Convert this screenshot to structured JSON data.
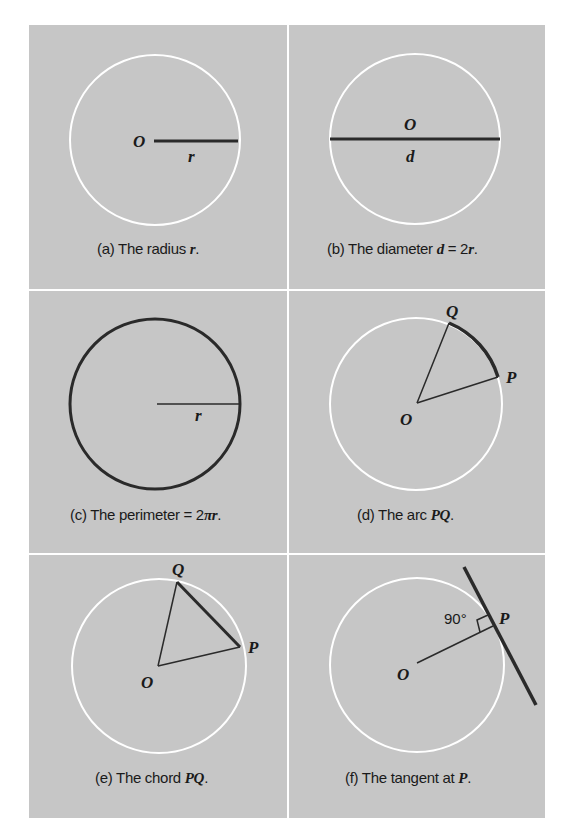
{
  "figure": {
    "background_color": "#c6c6c6",
    "divider_color": "#ffffff",
    "circle_color": "#ffffff",
    "ink_color": "#2a2a2a",
    "panels": [
      {
        "id": "a",
        "caption_prefix": "(a) The radius ",
        "caption_var": "r",
        "caption_suffix": ".",
        "labels": {
          "center": "O",
          "radius": "r"
        }
      },
      {
        "id": "b",
        "caption_prefix": "(b) The diameter ",
        "caption_var": "d",
        "caption_mid": " = 2",
        "caption_var2": "r",
        "caption_suffix": ".",
        "labels": {
          "center": "O",
          "diameter": "d"
        }
      },
      {
        "id": "c",
        "caption_prefix": "(c) The perimeter = 2",
        "caption_var": "πr",
        "caption_suffix": ".",
        "labels": {
          "radius": "r"
        }
      },
      {
        "id": "d",
        "caption_prefix": "(d) The arc ",
        "caption_var": "PQ",
        "caption_suffix": ".",
        "labels": {
          "center": "O",
          "point_p": "P",
          "point_q": "Q"
        }
      },
      {
        "id": "e",
        "caption_prefix": "(e) The chord ",
        "caption_var": "PQ",
        "caption_suffix": ".",
        "labels": {
          "center": "O",
          "point_p": "P",
          "point_q": "Q"
        }
      },
      {
        "id": "f",
        "caption_prefix": "(f) The tangent at ",
        "caption_var": "P",
        "caption_suffix": ".",
        "labels": {
          "center": "O",
          "point_p": "P",
          "angle": "90°"
        }
      }
    ]
  }
}
